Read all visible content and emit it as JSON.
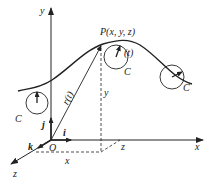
{
  "diagram": {
    "title": "",
    "labels": {
      "y_axis": "y",
      "x_axis": "x",
      "z_axis": "z",
      "origin": "O",
      "point": "P(x, y, z)",
      "position_vector": "r(t)",
      "tangent_param": "(t)",
      "curve_left": "C",
      "curve_mid": "C",
      "curve_right": "C",
      "unit_i": "i",
      "unit_j": "j",
      "unit_k": "k",
      "height_y": "y",
      "proj_x": "x",
      "proj_z": "z"
    },
    "colors": {
      "stroke": "#222222",
      "background": "#ffffff"
    }
  }
}
